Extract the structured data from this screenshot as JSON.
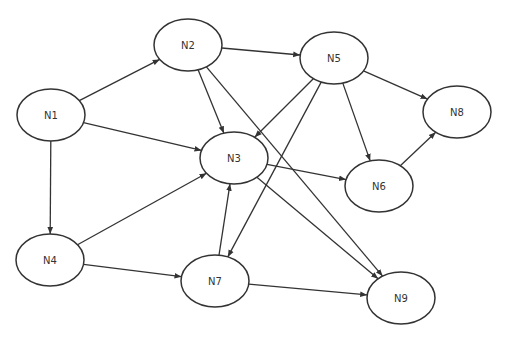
{
  "diagram": {
    "type": "directed-graph",
    "node_style": {
      "rx": 34,
      "ry": 26,
      "stroke": "#333333",
      "fill": "#ffffff"
    },
    "nodes": [
      {
        "id": "N1",
        "label": "N1",
        "x": 51,
        "y": 115
      },
      {
        "id": "N2",
        "label": "N2",
        "x": 188,
        "y": 45
      },
      {
        "id": "N3",
        "label": "N3",
        "x": 234,
        "y": 158
      },
      {
        "id": "N4",
        "label": "N4",
        "x": 50,
        "y": 260
      },
      {
        "id": "N5",
        "label": "N5",
        "x": 334,
        "y": 58
      },
      {
        "id": "N6",
        "label": "N6",
        "x": 379,
        "y": 186
      },
      {
        "id": "N7",
        "label": "N7",
        "x": 215,
        "y": 281
      },
      {
        "id": "N8",
        "label": "N8",
        "x": 457,
        "y": 112
      },
      {
        "id": "N9",
        "label": "N9",
        "x": 401,
        "y": 298
      }
    ],
    "edges": [
      {
        "from": "N1",
        "to": "N2"
      },
      {
        "from": "N1",
        "to": "N3"
      },
      {
        "from": "N1",
        "to": "N4"
      },
      {
        "from": "N2",
        "to": "N5"
      },
      {
        "from": "N2",
        "to": "N3"
      },
      {
        "from": "N2",
        "to": "N9"
      },
      {
        "from": "N5",
        "to": "N3"
      },
      {
        "from": "N5",
        "to": "N8"
      },
      {
        "from": "N5",
        "to": "N6"
      },
      {
        "from": "N5",
        "to": "N7"
      },
      {
        "from": "N3",
        "to": "N6"
      },
      {
        "from": "N3",
        "to": "N9"
      },
      {
        "from": "N4",
        "to": "N3"
      },
      {
        "from": "N4",
        "to": "N7"
      },
      {
        "from": "N7",
        "to": "N3"
      },
      {
        "from": "N7",
        "to": "N9"
      },
      {
        "from": "N6",
        "to": "N8"
      }
    ]
  }
}
